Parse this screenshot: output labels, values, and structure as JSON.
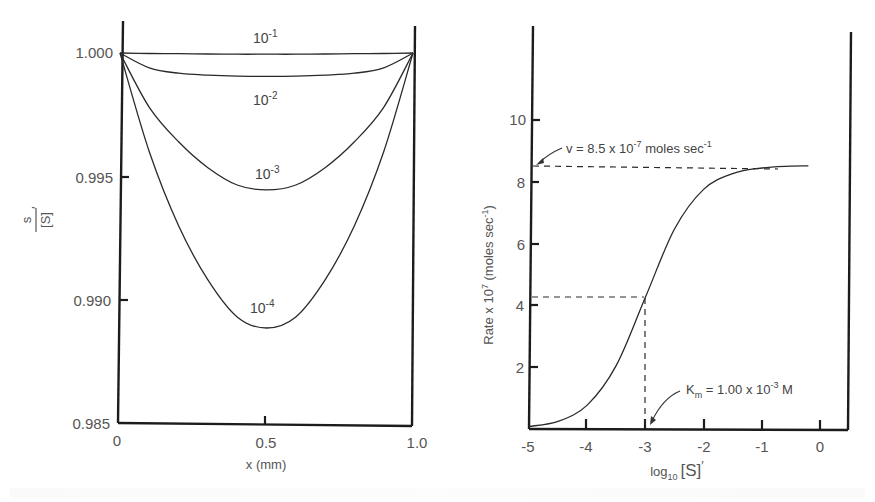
{
  "chart_data": [
    {
      "type": "line",
      "title": "",
      "xlabel": "x (mm)",
      "ylabel": "s / [S]'",
      "xlim": [
        0,
        1.0
      ],
      "ylim": [
        0.985,
        1.0
      ],
      "x_ticks": [
        "0",
        "0.5",
        "1.0"
      ],
      "y_ticks": [
        "1.000",
        "0.995",
        "0.990",
        "0.985"
      ],
      "grid": false,
      "legend": "inline curve labels",
      "x": [
        0,
        0.1,
        0.2,
        0.3,
        0.4,
        0.5,
        0.6,
        0.7,
        0.8,
        0.9,
        1.0
      ],
      "series": [
        {
          "name": "10^-1",
          "label_base": "10",
          "label_exp": "-1",
          "values": [
            1.0,
            0.99998,
            0.99997,
            0.99996,
            0.99995,
            0.99995,
            0.99995,
            0.99996,
            0.99997,
            0.99998,
            1.0
          ]
        },
        {
          "name": "10^-2",
          "label_base": "10",
          "label_exp": "-2",
          "values": [
            1.0,
            0.9994,
            0.99918,
            0.9991,
            0.99906,
            0.99905,
            0.99906,
            0.9991,
            0.99918,
            0.9994,
            1.0
          ]
        },
        {
          "name": "10^-3",
          "label_base": "10",
          "label_exp": "-3",
          "values": [
            1.0,
            0.9978,
            0.9964,
            0.99535,
            0.99465,
            0.99445,
            0.99465,
            0.99535,
            0.9964,
            0.9978,
            1.0
          ]
        },
        {
          "name": "10^-4",
          "label_base": "10",
          "label_exp": "-4",
          "values": [
            1.0,
            0.996,
            0.993,
            0.9908,
            0.9893,
            0.98885,
            0.9893,
            0.9908,
            0.993,
            0.996,
            1.0
          ]
        }
      ]
    },
    {
      "type": "line",
      "title": "",
      "xlabel": "log10 [S]'",
      "ylabel": "Rate x 10^7 (moles sec^-1)",
      "xlim": [
        -5,
        0.5
      ],
      "ylim": [
        0,
        12
      ],
      "x_ticks": [
        "-5",
        "-4",
        "-3",
        "-2",
        "-1",
        "0"
      ],
      "y_ticks": [
        "2",
        "4",
        "6",
        "8",
        "10"
      ],
      "grid": false,
      "x": [
        -5.0,
        -4.5,
        -4.0,
        -3.5,
        -3.0,
        -2.5,
        -2.0,
        -1.5,
        -1.0,
        -0.5,
        -0.2
      ],
      "series": [
        {
          "name": "Rate",
          "values": [
            0.08,
            0.25,
            0.77,
            2.05,
            4.25,
            6.45,
            7.73,
            8.24,
            8.42,
            8.48,
            8.49
          ]
        }
      ],
      "annotations": [
        {
          "text_prefix": "v = 8.5 x 10",
          "text_exp": "-7",
          "text_suffix": " moles sec",
          "text_suffix_exp": "-1",
          "y": 8.5,
          "style": "dashed horizontal"
        },
        {
          "text_prefix": "K",
          "text_sub": "m",
          "text_mid": " = 1.00 x 10",
          "text_exp": "-3",
          "text_suffix": " M",
          "x": -3.0,
          "y": 4.25,
          "style": "dashed horizontal + vertical"
        }
      ]
    }
  ],
  "left": {
    "y_ticks": [
      "1.000",
      "0.995",
      "0.990",
      "0.985"
    ],
    "x_ticks": [
      "0",
      "0.5",
      "1.0"
    ],
    "xlabel": "x (mm)",
    "ylabel_num": "s",
    "ylabel_den": "[S]",
    "ylabel_prime": "′",
    "curve_labels": [
      {
        "base": "10",
        "exp": "-1"
      },
      {
        "base": "10",
        "exp": "-2"
      },
      {
        "base": "10",
        "exp": "-3"
      },
      {
        "base": "10",
        "exp": "-4"
      }
    ]
  },
  "right": {
    "y_ticks": [
      "2",
      "4",
      "6",
      "8",
      "10"
    ],
    "x_ticks": [
      "-5",
      "-4",
      "-3",
      "-2",
      "-1",
      "0"
    ],
    "xlabel_log": "log",
    "xlabel_sub": "10",
    "xlabel_S": "[S]",
    "xlabel_prime": "′",
    "ylabel_a": "Rate x 10",
    "ylabel_exp": "7",
    "ylabel_b": " (moles sec",
    "ylabel_exp2": "-1",
    "ylabel_c": ")",
    "vmax_prefix": "v = 8.5 x 10",
    "vmax_exp": "-7",
    "vmax_mid": " moles sec",
    "vmax_exp2": "-1",
    "km_K": "K",
    "km_sub": "m",
    "km_mid": " = 1.00 x 10",
    "km_exp": "-3",
    "km_suffix": " M"
  }
}
